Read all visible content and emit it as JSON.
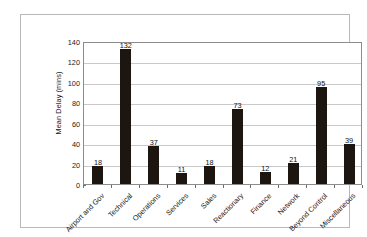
{
  "chart_data": {
    "type": "bar",
    "title": "",
    "subtitle": "",
    "xlabel": "",
    "ylabel": "Mean Delay (mins)",
    "ylim": [
      0,
      140
    ],
    "ytick_step": 20,
    "yticks": [
      "140",
      "120",
      "100",
      "80",
      "60",
      "40",
      "20",
      "0"
    ],
    "grid": true,
    "legend": false,
    "legend_position": "none",
    "bar_color": "#1c1510",
    "gridline_color": "#c9c9c9",
    "axis_color": "#8c8c8c",
    "categories": [
      "Airport and Gov",
      "Technical",
      "Operations",
      "Services",
      "Sales",
      "Reactionary",
      "Finance",
      "Network",
      "Beyond Control",
      "Miscellaneous"
    ],
    "values": [
      18,
      132,
      37,
      11,
      18,
      73,
      12,
      21,
      95,
      39
    ],
    "value_labels": [
      "18",
      "132",
      "37",
      "11",
      "18",
      "73",
      "12",
      "21",
      "95",
      "39"
    ]
  }
}
